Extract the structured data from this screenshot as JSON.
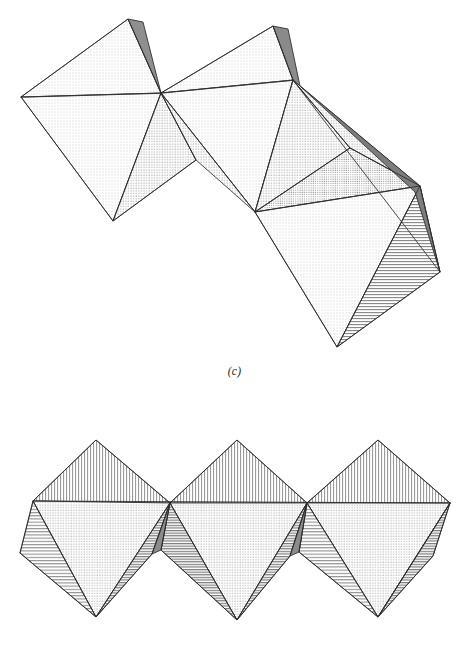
{
  "page": {
    "background_color": "#ffffff",
    "width": 469,
    "height": 666
  },
  "palette": {
    "stroke": "#2b2b2b",
    "dot_light": "#f4f4f4",
    "dot_mid": "#ebebeb",
    "hatch_light": "#efefef",
    "hatch_dark": "#b9b9b9",
    "sliver_dark": "#8f8f8f",
    "sliver_darkest": "#707070",
    "paper": "#ffffff"
  },
  "figures": [
    {
      "id": "figure-c",
      "caption": "(c)",
      "description": "Zigzag chain of three octahedra descending left to right",
      "unit_count": 3,
      "arrangement": "zigzag",
      "fill_styles": [
        "dot-stipple",
        "horizontal-hatch",
        "solid-dark-sliver"
      ],
      "vertices": {
        "o1_left": [
          21,
          97
        ],
        "o1_top": [
          128,
          19
        ],
        "o1_center": [
          161,
          93
        ],
        "o1_bottom": [
          113,
          221
        ],
        "o2_top": [
          273,
          26
        ],
        "o2_right": [
          293,
          80
        ],
        "o2_bottom": [
          255,
          212
        ],
        "o3_right_tip": [
          440,
          272
        ],
        "o3_bottom": [
          337,
          347
        ]
      }
    },
    {
      "id": "figure-d",
      "caption": "(d)",
      "description": "Horizontal row of three octahedra sharing vertices",
      "unit_count": 3,
      "arrangement": "linear-horizontal",
      "fill_styles": [
        "vertical-hatch",
        "dot-stipple",
        "horizontal-hatch",
        "solid-dark-sliver"
      ],
      "vertices": {
        "left_apex": [
          33,
          501
        ],
        "far_left": [
          20,
          553
        ],
        "junction_1": [
          170,
          503
        ],
        "junction_2": [
          307,
          503
        ],
        "right_edge": [
          450,
          503
        ],
        "bottom_1": [
          96,
          617
        ],
        "bottom_2": [
          237,
          620
        ],
        "bottom_3": [
          378,
          617
        ]
      }
    }
  ]
}
